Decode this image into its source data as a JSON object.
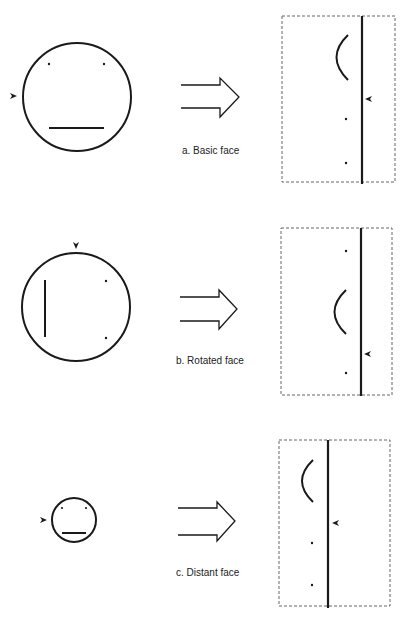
{
  "colors": {
    "ink": "#1a1a1a",
    "dash": "#555555",
    "background": "#ffffff"
  },
  "panels": [
    {
      "id": "a",
      "caption": "a. Basic face",
      "face": {
        "cx": 77,
        "cy": 97,
        "r": 54,
        "features": "eyes-top, mouth-horizontal-bottom",
        "marker_side": "left"
      },
      "projection": {
        "box": [
          282,
          16,
          395,
          182
        ],
        "axis_x": 362,
        "order_top_to_bottom": [
          "mouth-arc",
          "marker",
          "eye",
          "eye"
        ]
      }
    },
    {
      "id": "b",
      "caption": "b. Rotated face",
      "face": {
        "cx": 76,
        "cy": 307,
        "r": 54,
        "features": "mouth-vertical-left, eyes-right",
        "marker_side": "top"
      },
      "projection": {
        "box": [
          281,
          228,
          392,
          395
        ],
        "axis_x": 361,
        "order_top_to_bottom": [
          "eye",
          "mouth-arc",
          "marker",
          "eye"
        ]
      }
    },
    {
      "id": "c",
      "caption": "c. Distant face",
      "face": {
        "cx": 74,
        "cy": 520,
        "r": 22,
        "features": "eyes-top, mouth-horizontal-bottom",
        "marker_side": "left"
      },
      "projection": {
        "box": [
          279,
          440,
          390,
          606
        ],
        "axis_x": 328,
        "order_top_to_bottom": [
          "mouth-arc",
          "marker",
          "eye",
          "eye"
        ]
      }
    }
  ]
}
